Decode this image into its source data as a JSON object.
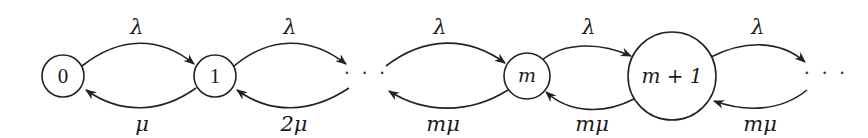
{
  "diagram": {
    "type": "birth-death state transition diagram",
    "nodes": [
      {
        "id": "n0",
        "label": "0",
        "cx": 63,
        "cy": 76,
        "r": 21
      },
      {
        "id": "n1",
        "label": "1",
        "cx": 215,
        "cy": 76,
        "r": 21
      },
      {
        "id": "ellipsis1",
        "label": "· · ·",
        "cx": 366,
        "cy": 76
      },
      {
        "id": "nm",
        "label": "m",
        "cx": 527,
        "cy": 76,
        "r": 23
      },
      {
        "id": "nm1",
        "label": "m + 1",
        "cx": 672,
        "cy": 76,
        "r": 44
      },
      {
        "id": "ellipsis2",
        "label": "· · ·",
        "cx": 826,
        "cy": 76
      }
    ],
    "forward_edges": [
      {
        "from": "0",
        "to": "1",
        "label": "λ"
      },
      {
        "from": "1",
        "to": "···",
        "label": "λ"
      },
      {
        "from": "···",
        "to": "m",
        "label": "λ"
      },
      {
        "from": "m",
        "to": "m + 1",
        "label": "λ"
      },
      {
        "from": "m + 1",
        "to": "···",
        "label": "λ"
      }
    ],
    "backward_edges": [
      {
        "from": "1",
        "to": "0",
        "label": "μ"
      },
      {
        "from": "···",
        "to": "1",
        "label": "2μ"
      },
      {
        "from": "m",
        "to": "···",
        "label": "mμ"
      },
      {
        "from": "m + 1",
        "to": "m",
        "label": "mμ"
      },
      {
        "from": "···",
        "to": "m + 1",
        "label": "mμ"
      }
    ],
    "colors": {
      "stroke": "#222222",
      "text": "#1a1a1a",
      "background": "#ffffff"
    }
  }
}
